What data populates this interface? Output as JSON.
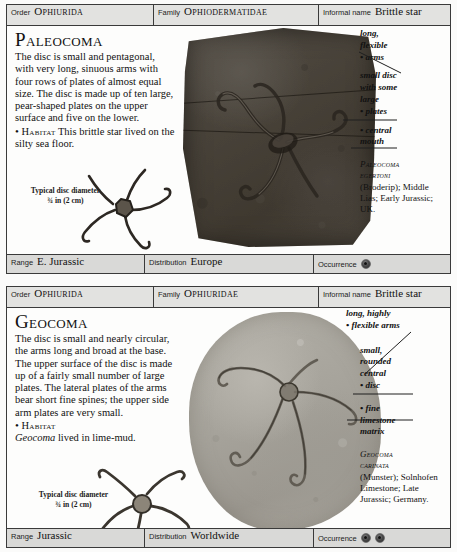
{
  "entries": [
    {
      "header": {
        "order_label": "Order",
        "order_value": "Ophiurida",
        "family_label": "Family",
        "family_value": "Ophiodermatidae",
        "informal_label": "Informal name",
        "informal_value": "Brittle star"
      },
      "genus": "Paleocoma",
      "description": "The disc is small and pentagonal, with very long, sinuous arms with four rows of plates of almost equal size. The disc is made up of ten large, pear-shaped plates on the upper surface and five on the lower.",
      "habitat_bullet": "•",
      "habitat_label": "Habitat",
      "habitat_text": " This brittle star lived on the silty sea floor.",
      "disc_caption_line1": "Typical disc diameter",
      "disc_caption_line2": "¾ in (2 cm)",
      "annotations": [
        "long,",
        "flexible",
        "• arms",
        "small disc",
        "with some",
        "large",
        "• plates",
        "• central",
        "mouth"
      ],
      "specimen_caption": {
        "species_line1": "Paleocoma",
        "species_line2": "egertoni",
        "rest": "(Broderip); Middle Lias; Early Jurassic; UK."
      },
      "footer": {
        "range_label": "Range",
        "range_value": "E. Jurassic",
        "distribution_label": "Distribution",
        "distribution_value": "Europe",
        "occurrence_label": "Occurrence",
        "occurrence_count": 1
      }
    },
    {
      "header": {
        "order_label": "Order",
        "order_value": "Ophiurida",
        "family_label": "Family",
        "family_value": "Ophiuridae",
        "informal_label": "Informal name",
        "informal_value": "Brittle star"
      },
      "genus": "Geocoma",
      "description": "The disc is small and nearly circular, the arms long and broad at the base. The upper surface of the disc is made up of a fairly small number of large plates. The lateral plates of the arms bear short fine spines; the upper side arm plates are very small.",
      "habitat_bullet": "•",
      "habitat_label": "Habitat",
      "habitat_species": "Geocoma",
      "habitat_text": " lived in lime-mud.",
      "disc_caption_line1": "Typical disc diameter",
      "disc_caption_line2": "¾ in (2 cm)",
      "annotations": [
        "long, highly",
        "• flexible arms",
        "small,",
        "rounded",
        "central",
        "• disc",
        "• fine",
        "limestone",
        "matrix"
      ],
      "specimen_caption": {
        "species_line1": "Geocoma",
        "species_line2": "carinata",
        "rest": "(Munster); Solnhofen Limestone; Late Jurassic; Germany."
      },
      "footer": {
        "range_label": "Range",
        "range_value": "Jurassic",
        "distribution_label": "Distribution",
        "distribution_value": "Worldwide",
        "occurrence_label": "Occurrence",
        "occurrence_count": 2
      }
    }
  ],
  "colors": {
    "page_background": "#fbfbfa",
    "header_band": "#e2e2e0",
    "footer_band": "#d9d9d7",
    "border": "#3a3a3a",
    "specimen_1_rock": "#4a443d",
    "specimen_2_rock": "#a6a39b",
    "text": "#111111"
  }
}
